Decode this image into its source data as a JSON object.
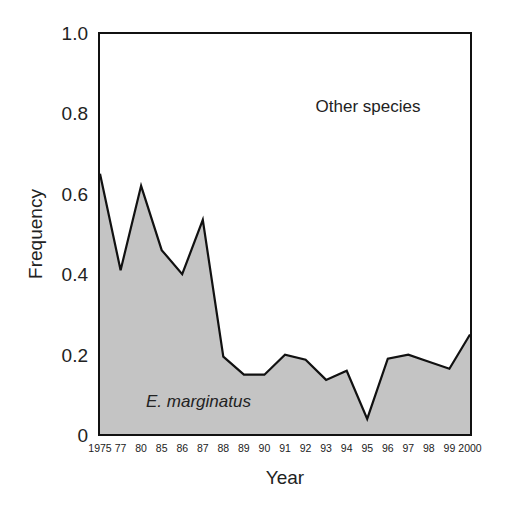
{
  "chart_data": {
    "type": "area",
    "title": "",
    "xlabel": "Year",
    "ylabel": "Frequency",
    "ylim": [
      0,
      1.0
    ],
    "yticks": [
      "0",
      "0.2",
      "0.4",
      "0.6",
      "0.8",
      "1.0"
    ],
    "ytick_values": [
      0,
      0.2,
      0.4,
      0.6,
      0.8,
      1.0
    ],
    "categories": [
      "1975",
      "77",
      "80",
      "85",
      "86",
      "87",
      "88",
      "89",
      "90",
      "91",
      "92",
      "93",
      "94",
      "95",
      "96",
      "97",
      "98",
      "99",
      "2000"
    ],
    "series": [
      {
        "name": "E. marginatus",
        "values": [
          0.65,
          0.41,
          0.62,
          0.46,
          0.4,
          0.535,
          0.195,
          0.15,
          0.15,
          0.2,
          0.187,
          0.137,
          0.16,
          0.04,
          0.19,
          0.2,
          0.182,
          0.165,
          0.25
        ],
        "fill": "#c4c4c4",
        "line": "#111111"
      }
    ],
    "annotations": [
      {
        "text": "Other species",
        "region": "above line",
        "style": "normal"
      },
      {
        "text": "E. marginatus",
        "region": "below line (shaded)",
        "style": "italic"
      }
    ],
    "grid": false,
    "legend": null
  }
}
